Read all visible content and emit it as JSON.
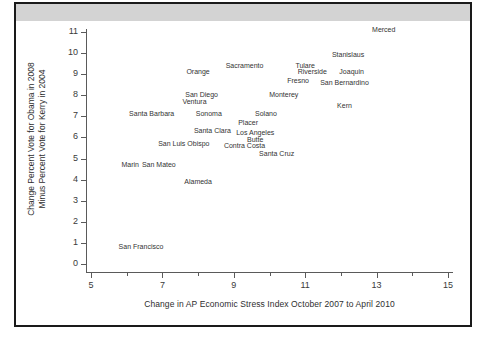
{
  "figure": {
    "header_band_color": "#d3d3d3",
    "frame_color": "#1a1a1a",
    "background": "#ffffff"
  },
  "chart_data": {
    "type": "scatter",
    "title": "",
    "subtitle": "",
    "xlabel": "Change in AP Economic Stress Index October 2007 to April 2010",
    "ylabel_line1": "Change Percent Vote for Obama in 2008",
    "ylabel_line2": "Minus Percent Vote for Kerry in 2004",
    "xlim": [
      5,
      15
    ],
    "ylim": [
      0,
      11
    ],
    "grid": false,
    "legend": "none",
    "marker_style": "text-label-only",
    "xticks": [
      5,
      7,
      9,
      11,
      13,
      15
    ],
    "xticks_minor": [
      6,
      8,
      10,
      12,
      14
    ],
    "xtick_labels": [
      "5",
      "7",
      "9",
      "11",
      "13",
      "15"
    ],
    "yticks": [
      0,
      1,
      2,
      3,
      4,
      5,
      6,
      7,
      8,
      9,
      10,
      11
    ],
    "ytick_labels": [
      "0",
      "1",
      "2",
      "3",
      "4",
      "5",
      "6",
      "7",
      "8",
      "9",
      "10",
      "11"
    ],
    "labels": [
      "Merced",
      "Stanislaus",
      "Tulare",
      "Sacramento",
      "Orange",
      "Riverside",
      "Joaquin",
      "Fresno",
      "San Bernardino",
      "San Diego",
      "Monterey",
      "Ventura",
      "Kern",
      "Sonoma",
      "Santa Barbara",
      "Solano",
      "Placer",
      "Santa Clara",
      "Los Angeles",
      "Butte",
      "San Luis Obispo",
      "Contra Costa",
      "Santa Cruz",
      "Marin",
      "San Mateo",
      "Alameda",
      "San Francisco"
    ],
    "x": [
      13.2,
      12.2,
      11.0,
      9.3,
      8.0,
      11.2,
      12.3,
      10.8,
      12.1,
      8.1,
      10.4,
      7.9,
      12.1,
      8.3,
      6.7,
      9.9,
      9.4,
      8.4,
      9.6,
      9.6,
      7.6,
      9.3,
      10.2,
      6.1,
      6.9,
      8.0,
      6.4
    ],
    "y": [
      11.1,
      9.9,
      9.4,
      9.4,
      9.1,
      9.1,
      9.1,
      8.7,
      8.6,
      8.0,
      8.0,
      7.7,
      7.5,
      7.1,
      7.1,
      7.1,
      6.7,
      6.3,
      6.2,
      5.9,
      5.7,
      5.6,
      5.2,
      4.7,
      4.7,
      3.9,
      0.8
    ],
    "points": [
      {
        "label": "Merced",
        "x": 13.2,
        "y": 11.1
      },
      {
        "label": "Stanislaus",
        "x": 12.2,
        "y": 9.9
      },
      {
        "label": "Tulare",
        "x": 11.0,
        "y": 9.4
      },
      {
        "label": "Sacramento",
        "x": 9.3,
        "y": 9.4
      },
      {
        "label": "Orange",
        "x": 8.0,
        "y": 9.1
      },
      {
        "label": "Riverside",
        "x": 11.2,
        "y": 9.1
      },
      {
        "label": "Joaquin",
        "x": 12.3,
        "y": 9.1
      },
      {
        "label": "Fresno",
        "x": 10.8,
        "y": 8.7
      },
      {
        "label": "San Bernardino",
        "x": 12.1,
        "y": 8.6
      },
      {
        "label": "San Diego",
        "x": 8.1,
        "y": 8.0
      },
      {
        "label": "Monterey",
        "x": 10.4,
        "y": 8.0
      },
      {
        "label": "Ventura",
        "x": 7.9,
        "y": 7.7
      },
      {
        "label": "Kern",
        "x": 12.1,
        "y": 7.5
      },
      {
        "label": "Sonoma",
        "x": 8.3,
        "y": 7.1
      },
      {
        "label": "Santa Barbara",
        "x": 6.7,
        "y": 7.1
      },
      {
        "label": "Solano",
        "x": 9.9,
        "y": 7.1
      },
      {
        "label": "Placer",
        "x": 9.4,
        "y": 6.7
      },
      {
        "label": "Santa Clara",
        "x": 8.4,
        "y": 6.3
      },
      {
        "label": "Los Angeles",
        "x": 9.6,
        "y": 6.2
      },
      {
        "label": "Butte",
        "x": 9.6,
        "y": 5.9
      },
      {
        "label": "San Luis Obispo",
        "x": 7.6,
        "y": 5.7
      },
      {
        "label": "Contra Costa",
        "x": 9.3,
        "y": 5.6
      },
      {
        "label": "Santa Cruz",
        "x": 10.2,
        "y": 5.2
      },
      {
        "label": "Marin",
        "x": 6.1,
        "y": 4.7
      },
      {
        "label": "San Mateo",
        "x": 6.9,
        "y": 4.7
      },
      {
        "label": "Alameda",
        "x": 8.0,
        "y": 3.9
      },
      {
        "label": "San Francisco",
        "x": 6.4,
        "y": 0.8
      }
    ]
  }
}
